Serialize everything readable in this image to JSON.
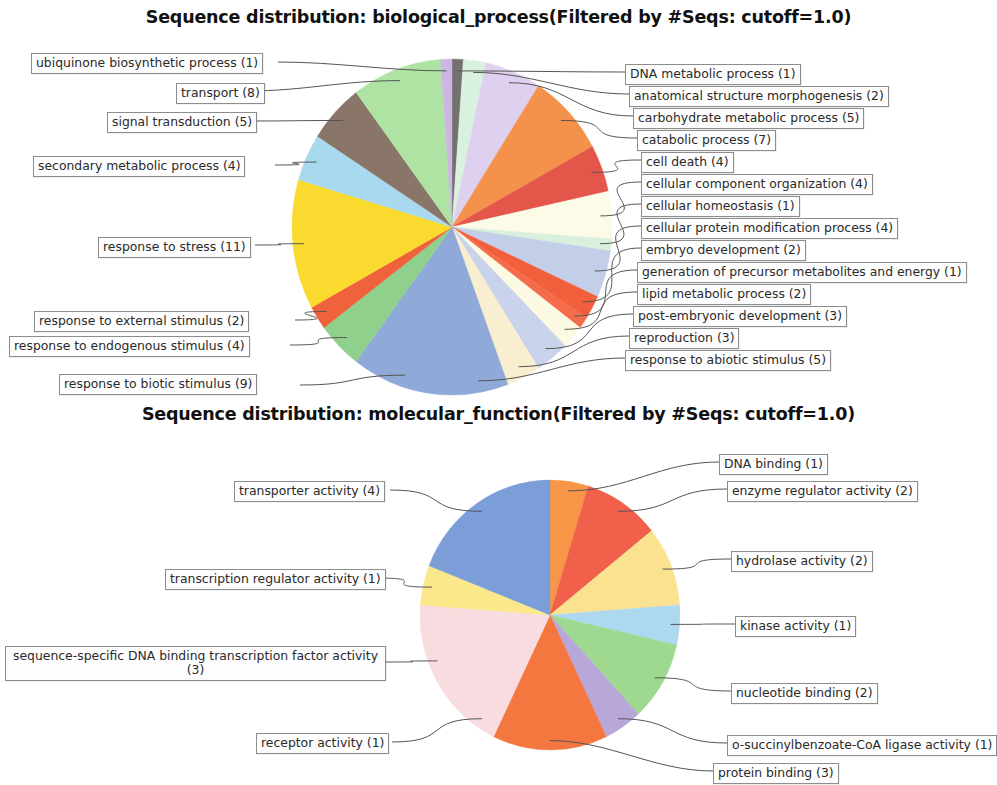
{
  "charts": [
    {
      "id": "biological_process",
      "title": "Sequence distribution: biological_process(Filtered by #Seqs: cutoff=1.0)"
    },
    {
      "id": "molecular_function",
      "title": "Sequence distribution: molecular_function(Filtered by #Seqs: cutoff=1.0)"
    }
  ],
  "chart_data": [
    {
      "type": "pie",
      "title": "Sequence distribution: biological_process(Filtered by #Seqs: cutoff=1.0)",
      "xlabel": "",
      "ylabel": "",
      "legend_position": "callout-labels",
      "total": 88,
      "start_angle_deg": 0,
      "direction": "clockwise",
      "categories": [
        "DNA metabolic process",
        "anatomical structure morphogenesis",
        "carbohydrate metabolic process",
        "catabolic process",
        "cell death",
        "cellular component organization",
        "cellular homeostasis",
        "cellular protein modification process",
        "embryo development",
        "generation of precursor metabolites and energy",
        "lipid metabolic process",
        "post-embryonic development",
        "reproduction",
        "response to abiotic stimulus",
        "response to biotic stimulus",
        "response to endogenous stimulus",
        "response to external stimulus",
        "response to stress",
        "secondary metabolic process",
        "signal transduction",
        "transport",
        "ubiquinone biosynthetic process"
      ],
      "values": [
        1,
        2,
        5,
        7,
        4,
        4,
        1,
        4,
        2,
        1,
        2,
        3,
        3,
        5,
        9,
        4,
        2,
        11,
        4,
        5,
        8,
        1
      ],
      "colors": [
        "#767171",
        "#d9f2e0",
        "#ded0ef",
        "#f4924c",
        "#e5564a",
        "#fbfbe8",
        "#d9f0dc",
        "#c3cfe8",
        "#f25f3c",
        "#f46c4a",
        "#fdfae3",
        "#c9d4ec",
        "#f9efd0",
        "#8fa9d8",
        "#8fa9d8",
        "#8fd08c",
        "#f0623c",
        "#fada2e",
        "#a9d9ef",
        "#8a7668",
        "#aee3a4",
        "#cdb7e2"
      ],
      "labels": [
        {
          "text": "DNA metabolic process (1)",
          "side": "right"
        },
        {
          "text": "anatomical structure morphogenesis (2)",
          "side": "right"
        },
        {
          "text": "carbohydrate metabolic process (5)",
          "side": "right"
        },
        {
          "text": "catabolic process (7)",
          "side": "right"
        },
        {
          "text": "cell death (4)",
          "side": "right"
        },
        {
          "text": "cellular component organization (4)",
          "side": "right"
        },
        {
          "text": "cellular homeostasis (1)",
          "side": "right"
        },
        {
          "text": "cellular protein modification process (4)",
          "side": "right"
        },
        {
          "text": "embryo development (2)",
          "side": "right"
        },
        {
          "text": "generation of precursor metabolites and energy (1)",
          "side": "right"
        },
        {
          "text": "lipid metabolic process (2)",
          "side": "right"
        },
        {
          "text": "post-embryonic development (3)",
          "side": "right"
        },
        {
          "text": "reproduction (3)",
          "side": "right"
        },
        {
          "text": "response to abiotic stimulus (5)",
          "side": "right"
        },
        {
          "text": "response to biotic stimulus (9)",
          "side": "left"
        },
        {
          "text": "response to endogenous stimulus (4)",
          "side": "left"
        },
        {
          "text": "response to external stimulus (2)",
          "side": "left"
        },
        {
          "text": "response to stress (11)",
          "side": "left"
        },
        {
          "text": "secondary metabolic process (4)",
          "side": "left"
        },
        {
          "text": "signal transduction (5)",
          "side": "left"
        },
        {
          "text": "transport (8)",
          "side": "left"
        },
        {
          "text": "ubiquinone biosynthetic process (1)",
          "side": "left"
        }
      ]
    },
    {
      "type": "pie",
      "title": "Sequence distribution: molecular_function(Filtered by #Seqs: cutoff=1.0)",
      "xlabel": "",
      "ylabel": "",
      "legend_position": "callout-labels",
      "total": 20,
      "start_angle_deg": 0,
      "direction": "clockwise",
      "categories": [
        "DNA binding",
        "enzyme regulator activity",
        "hydrolase activity",
        "kinase activity",
        "nucleotide binding",
        "o-succinylbenzoate-CoA ligase activity",
        "protein binding",
        "receptor activity",
        "sequence-specific DNA binding transcription factor activity",
        "transcription regulator activity",
        "transporter activity"
      ],
      "values": [
        1,
        2,
        2,
        1,
        2,
        1,
        3,
        1,
        3,
        1,
        4
      ],
      "colors": [
        "#f79646",
        "#f1604a",
        "#fbe291",
        "#add8f0",
        "#9fd98f",
        "#b8a7d9",
        "#f4773f",
        "#f8dce0",
        "#f8dce0",
        "#fbe88a",
        "#7b9ed9"
      ],
      "labels": [
        {
          "text": "DNA binding (1)",
          "side": "right"
        },
        {
          "text": "enzyme regulator activity (2)",
          "side": "right"
        },
        {
          "text": "hydrolase activity (2)",
          "side": "right"
        },
        {
          "text": "kinase activity (1)",
          "side": "right"
        },
        {
          "text": "nucleotide binding (2)",
          "side": "right"
        },
        {
          "text": "o-succinylbenzoate-CoA ligase activity (1)",
          "side": "right"
        },
        {
          "text": "protein binding (3)",
          "side": "right"
        },
        {
          "text": "receptor activity (1)",
          "side": "left"
        },
        {
          "text": "sequence-specific DNA binding transcription factor activity (3)",
          "side": "left"
        },
        {
          "text": "transcription regulator activity (1)",
          "side": "left"
        },
        {
          "text": "transporter activity (4)",
          "side": "left"
        }
      ]
    }
  ],
  "bp_labels": {
    "l0": "ubiquinone biosynthetic process (1)",
    "l1": "transport (8)",
    "l2": "signal transduction (5)",
    "l3": "secondary metabolic process (4)",
    "l4": "response to stress (11)",
    "l5": "response to external stimulus (2)",
    "l6": "response to endogenous stimulus (4)",
    "l7": "response to biotic stimulus (9)",
    "r0": "DNA metabolic process (1)",
    "r1": "anatomical structure morphogenesis (2)",
    "r2": "carbohydrate metabolic process (5)",
    "r3": "catabolic process (7)",
    "r4": "cell death (4)",
    "r5": "cellular component organization (4)",
    "r6": "cellular homeostasis (1)",
    "r7": "cellular protein modification process (4)",
    "r8": "embryo development (2)",
    "r9": "generation of precursor metabolites and energy (1)",
    "r10": "lipid metabolic process (2)",
    "r11": "post-embryonic development (3)",
    "r12": "reproduction (3)",
    "r13": "response to abiotic stimulus (5)"
  },
  "mf_labels": {
    "l0": "transporter activity (4)",
    "l1": "transcription regulator activity (1)",
    "l2": "sequence-specific DNA binding transcription factor activity (3)",
    "l3": "receptor activity (1)",
    "r0": "DNA binding (1)",
    "r1": "enzyme regulator activity (2)",
    "r2": "hydrolase activity (2)",
    "r3": "kinase activity (1)",
    "r4": "nucleotide binding (2)",
    "r5": "o-succinylbenzoate-CoA ligase activity (1)",
    "r6": "protein binding (3)"
  }
}
